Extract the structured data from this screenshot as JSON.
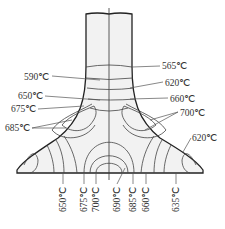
{
  "diagram": {
    "type": "isotherm-cross-section",
    "unit": "℃",
    "labels_left": [
      {
        "id": "l590",
        "text": "590℃",
        "x": 24,
        "y": 80
      },
      {
        "id": "l650",
        "text": "650℃",
        "x": 18,
        "y": 99
      },
      {
        "id": "l675",
        "text": "675℃",
        "x": 11,
        "y": 112
      },
      {
        "id": "l685",
        "text": "685℃",
        "x": 5,
        "y": 131
      }
    ],
    "labels_right": [
      {
        "id": "r565",
        "text": "565℃",
        "x": 162,
        "y": 69
      },
      {
        "id": "r620",
        "text": "620℃",
        "x": 165,
        "y": 86
      },
      {
        "id": "r660",
        "text": "660℃",
        "x": 170,
        "y": 102
      },
      {
        "id": "r700",
        "text": "700℃",
        "x": 180,
        "y": 116
      },
      {
        "id": "r620b",
        "text": "620℃",
        "x": 192,
        "y": 141
      }
    ],
    "labels_bottom": [
      {
        "id": "b650",
        "text": "650℃",
        "x": 63
      },
      {
        "id": "b675",
        "text": "675℃",
        "x": 84
      },
      {
        "id": "b700",
        "text": "700℃",
        "x": 96
      },
      {
        "id": "b690",
        "text": "690℃",
        "x": 117
      },
      {
        "id": "b685",
        "text": "685℃",
        "x": 133
      },
      {
        "id": "b660",
        "text": "660℃",
        "x": 146
      },
      {
        "id": "b635",
        "text": "635℃",
        "x": 176
      }
    ]
  }
}
